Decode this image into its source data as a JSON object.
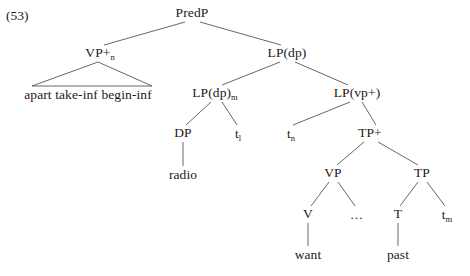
{
  "figure": {
    "example_number": "(53)",
    "type": "syntax-tree",
    "edge_color": "#555555",
    "text_color": "#1a1a1a",
    "background": "#ffffff"
  },
  "tree": {
    "nodes": [
      {
        "id": "predp",
        "label": "PredP",
        "sub": "",
        "x": 192,
        "y": 13,
        "kind": "category"
      },
      {
        "id": "vp_plus_n",
        "label": "VP+",
        "sub": "n",
        "x": 100,
        "y": 53,
        "kind": "category"
      },
      {
        "id": "lp_dp",
        "label": "LP(dp)",
        "sub": "",
        "x": 287,
        "y": 53,
        "kind": "category"
      },
      {
        "id": "vp_terminal",
        "label": "apart take-inf begin-inf",
        "sub": "",
        "x": 88,
        "y": 95,
        "kind": "terminal"
      },
      {
        "id": "lp_dp_m",
        "label": "LP(dp)",
        "sub": "m",
        "x": 215,
        "y": 93,
        "kind": "category"
      },
      {
        "id": "lp_vp_plus",
        "label": "LP(vp+)",
        "sub": "",
        "x": 357,
        "y": 93,
        "kind": "category"
      },
      {
        "id": "dp",
        "label": "DP",
        "sub": "",
        "x": 183,
        "y": 133,
        "kind": "category"
      },
      {
        "id": "trace_l",
        "label": "t",
        "sub": "l",
        "x": 238,
        "y": 133,
        "kind": "trace"
      },
      {
        "id": "trace_n",
        "label": "t",
        "sub": "n",
        "x": 291,
        "y": 133,
        "kind": "trace"
      },
      {
        "id": "tp_plus",
        "label": "TP+",
        "sub": "",
        "x": 370,
        "y": 133,
        "kind": "category"
      },
      {
        "id": "radio",
        "label": "radio",
        "sub": "",
        "x": 183,
        "y": 175,
        "kind": "terminal"
      },
      {
        "id": "vp",
        "label": "VP",
        "sub": "",
        "x": 333,
        "y": 173,
        "kind": "category"
      },
      {
        "id": "tp",
        "label": "TP",
        "sub": "",
        "x": 422,
        "y": 173,
        "kind": "category"
      },
      {
        "id": "v",
        "label": "V",
        "sub": "",
        "x": 308,
        "y": 214,
        "kind": "category"
      },
      {
        "id": "ellipsis",
        "label": "…",
        "sub": "",
        "x": 357,
        "y": 214,
        "kind": "ellipsis"
      },
      {
        "id": "t",
        "label": "T",
        "sub": "",
        "x": 398,
        "y": 214,
        "kind": "category"
      },
      {
        "id": "trace_m",
        "label": "t",
        "sub": "m",
        "x": 447,
        "y": 214,
        "kind": "trace"
      },
      {
        "id": "want",
        "label": "want",
        "sub": "",
        "x": 308,
        "y": 255,
        "kind": "terminal"
      },
      {
        "id": "past",
        "label": "past",
        "sub": "",
        "x": 398,
        "y": 255,
        "kind": "terminal"
      }
    ],
    "edges": [
      {
        "from": "predp",
        "to": "vp_plus_n",
        "x1": 185,
        "y1": 22,
        "x2": 104,
        "y2": 45
      },
      {
        "from": "predp",
        "to": "lp_dp",
        "x1": 200,
        "y1": 22,
        "x2": 281,
        "y2": 45
      },
      {
        "from": "vp_plus_n",
        "to": "vp_terminal",
        "x1": 98,
        "y1": 62,
        "x2": 32,
        "y2": 86,
        "style": "triangle-left"
      },
      {
        "from": "vp_plus_n",
        "to": "vp_terminal",
        "x1": 98,
        "y1": 62,
        "x2": 152,
        "y2": 86,
        "style": "triangle-right"
      },
      {
        "from": "vp_plus_n",
        "to": "vp_terminal",
        "x1": 32,
        "y1": 86,
        "x2": 152,
        "y2": 86,
        "style": "triangle-base"
      },
      {
        "from": "lp_dp",
        "to": "lp_dp_m",
        "x1": 280,
        "y1": 62,
        "x2": 222,
        "y2": 85
      },
      {
        "from": "lp_dp",
        "to": "lp_vp_plus",
        "x1": 295,
        "y1": 62,
        "x2": 348,
        "y2": 85
      },
      {
        "from": "lp_dp_m",
        "to": "dp",
        "x1": 211,
        "y1": 102,
        "x2": 186,
        "y2": 125
      },
      {
        "from": "lp_dp_m",
        "to": "trace_l",
        "x1": 222,
        "y1": 102,
        "x2": 237,
        "y2": 125
      },
      {
        "from": "lp_vp_plus",
        "to": "trace_n",
        "x1": 350,
        "y1": 102,
        "x2": 293,
        "y2": 125
      },
      {
        "from": "lp_vp_plus",
        "to": "tp_plus",
        "x1": 362,
        "y1": 102,
        "x2": 376,
        "y2": 125
      },
      {
        "from": "dp",
        "to": "radio",
        "x1": 183,
        "y1": 142,
        "x2": 183,
        "y2": 166
      },
      {
        "from": "tp_plus",
        "to": "vp",
        "x1": 364,
        "y1": 142,
        "x2": 337,
        "y2": 165
      },
      {
        "from": "tp_plus",
        "to": "tp",
        "x1": 378,
        "y1": 142,
        "x2": 418,
        "y2": 165
      },
      {
        "from": "vp",
        "to": "v",
        "x1": 329,
        "y1": 182,
        "x2": 311,
        "y2": 206
      },
      {
        "from": "vp",
        "to": "ellipsis",
        "x1": 338,
        "y1": 182,
        "x2": 355,
        "y2": 206
      },
      {
        "from": "tp",
        "to": "t",
        "x1": 418,
        "y1": 182,
        "x2": 400,
        "y2": 206
      },
      {
        "from": "tp",
        "to": "trace_m",
        "x1": 427,
        "y1": 182,
        "x2": 445,
        "y2": 206
      },
      {
        "from": "v",
        "to": "want",
        "x1": 308,
        "y1": 223,
        "x2": 308,
        "y2": 246
      },
      {
        "from": "t",
        "to": "past",
        "x1": 398,
        "y1": 223,
        "x2": 398,
        "y2": 246
      }
    ]
  }
}
